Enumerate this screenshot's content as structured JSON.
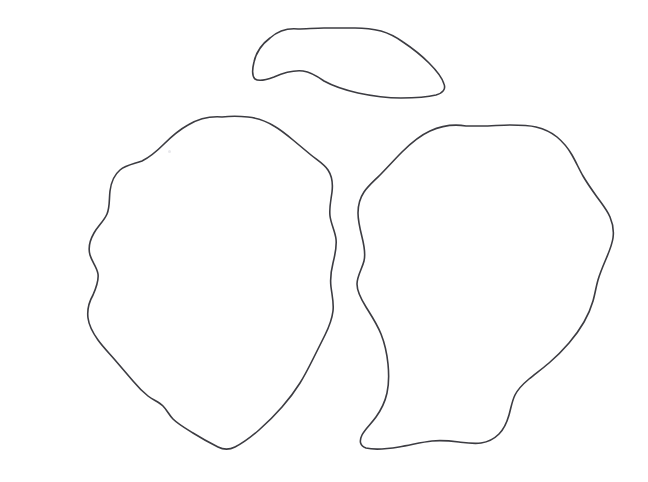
{
  "canvas": {
    "width": 648,
    "height": 482,
    "background_color": "#ffffff",
    "title": "Leaf Outline Drawing"
  },
  "style": {
    "stroke_color": "#3c3c42",
    "stroke_width": 1.6,
    "fill": "none"
  },
  "shapes": [
    {
      "name": "top-leaf-outline",
      "label": "Top leaf blade outline",
      "bbox": {
        "x": 252,
        "y": 27,
        "width": 193,
        "height": 73
      },
      "path": "M 298 29 C 288 28 278 31 270 38 C 262 44 256 53 254 62 C 252 70 252 76 255 79 C 259 82 266 80 274 77 C 283 73 293 70 303 71 C 311 72 317 76 324 81 C 333 86 345 90 358 93 C 372 96 387 98 401 98 C 415 98 428 97 436 95 C 443 93 446 89 444 84 C 442 77 436 70 429 63 C 421 55 412 48 403 42 C 396 37 388 33 381 31 C 373 29 364 28 355 28 C 345 28 334 28 324 28 C 315 28 306 29 298 29 Z"
    },
    {
      "name": "left-leaf-outline",
      "label": "Left leaf blade outline",
      "bbox": {
        "x": 86,
        "y": 116,
        "width": 252,
        "height": 334
      },
      "path": "M 222 117 C 210 116 198 119 188 125 C 179 130 171 137 164 144 C 157 151 150 157 142 161 C 134 164 126 165 120 170 C 114 175 111 183 110 191 C 109 199 110 207 107 214 C 104 221 98 226 94 233 C 90 240 88 248 90 255 C 92 262 97 267 98 274 C 99 281 96 288 93 295 C 89 302 87 310 88 318 C 89 326 93 333 98 340 C 103 347 109 353 115 360 C 121 367 127 374 133 381 C 138 387 143 392 148 396 C 153 400 159 402 163 406 C 167 410 169 415 173 419 C 178 424 185 428 193 433 C 201 438 210 443 218 447 C 224 450 229 450 235 447 C 243 443 251 437 259 430 C 267 423 275 415 282 407 C 289 399 295 391 300 383 C 305 375 309 367 313 359 C 317 351 321 343 325 335 C 329 327 332 319 333 311 C 334 303 332 295 331 287 C 330 279 331 271 333 263 C 335 255 337 247 336 239 C 335 231 331 224 330 216 C 329 208 331 200 332 192 C 333 184 332 176 328 170 C 324 164 317 160 311 155 C 305 150 299 145 293 140 C 287 135 281 130 274 126 C 266 121 257 118 248 117 C 239 116 230 116 222 117 Z"
    },
    {
      "name": "right-leaf-outline",
      "label": "Right leaf blade outline",
      "bbox": {
        "x": 356,
        "y": 124,
        "width": 257,
        "height": 325
      },
      "path": "M 466 126 C 454 124 441 126 430 131 C 419 136 410 144 402 152 C 394 160 387 168 380 175 C 374 181 368 186 364 192 C 360 198 358 205 358 213 C 358 221 360 229 362 237 C 364 245 366 253 364 261 C 362 269 357 276 357 284 C 357 292 361 299 366 307 C 371 315 377 324 381 334 C 385 344 387 354 388 364 C 389 374 389 384 387 393 C 385 402 381 410 376 417 C 371 424 365 429 362 435 C 359 441 360 446 366 448 C 374 450 387 449 399 447 C 411 445 422 442 432 441 C 442 440 451 441 459 442 C 467 443 474 444 481 443 C 488 442 494 439 499 434 C 504 429 507 422 509 415 C 511 408 512 401 515 395 C 518 389 523 384 529 379 C 535 374 542 369 549 363 C 556 357 563 350 569 343 C 575 336 580 329 584 322 C 588 315 591 308 593 301 C 595 294 596 287 598 280 C 600 273 603 266 606 259 C 609 252 612 245 613 238 C 614 231 613 224 610 217 C 607 210 602 204 597 197 C 592 190 587 183 583 176 C 579 169 576 162 572 155 C 568 148 563 142 557 137 C 551 132 544 129 536 127 C 528 125 519 125 510 125 C 501 125 491 126 482 126 C 477 126 471 126 466 126 Z"
    }
  ],
  "artifacts": [
    {
      "name": "faint-speck",
      "x": 168,
      "y": 150
    }
  ]
}
